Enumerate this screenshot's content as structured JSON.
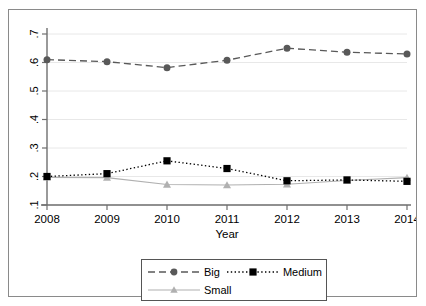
{
  "chart_data": {
    "type": "line",
    "title": "",
    "subtitle": "",
    "xlabel": "Year",
    "ylabel": "",
    "x": [
      2008,
      2009,
      2010,
      2011,
      2012,
      2013,
      2014
    ],
    "categories": [
      "2008",
      "2009",
      "2010",
      "2011",
      "2012",
      "2013",
      "2014"
    ],
    "xlim": [
      2008,
      2014
    ],
    "ylim": [
      0.1,
      0.7
    ],
    "yticks": [
      0.1,
      0.2,
      0.3,
      0.4,
      0.5,
      0.6,
      0.7
    ],
    "ytick_labels": [
      ".1",
      ".2",
      ".3",
      ".4",
      ".5",
      ".6",
      ".7"
    ],
    "xticks": [
      2008,
      2009,
      2010,
      2011,
      2012,
      2013,
      2014
    ],
    "xtick_labels": [
      "2008",
      "2009",
      "2010",
      "2011",
      "2012",
      "2013",
      "2014"
    ],
    "grid": true,
    "grid_axis": "y",
    "grid_color": "#e8e8e8",
    "legend_position": "bottom",
    "series": [
      {
        "name": "Big",
        "values": [
          0.61,
          0.603,
          0.582,
          0.608,
          0.65,
          0.636,
          0.63
        ],
        "color": "#595959",
        "marker": "circle",
        "linestyle": "dashed"
      },
      {
        "name": "Medium",
        "values": [
          0.2,
          0.21,
          0.255,
          0.228,
          0.185,
          0.188,
          0.183
        ],
        "color": "#000000",
        "marker": "square",
        "linestyle": "dotted"
      },
      {
        "name": "Small",
        "values": [
          0.197,
          0.196,
          0.172,
          0.17,
          0.173,
          0.186,
          0.196
        ],
        "color": "#b0b0b0",
        "marker": "triangle",
        "linestyle": "solid"
      }
    ]
  },
  "axis": {
    "x_title": "Year",
    "y_tick_0": ".1",
    "y_tick_1": ".2",
    "y_tick_2": ".3",
    "y_tick_3": ".4",
    "y_tick_4": ".5",
    "y_tick_5": ".6",
    "y_tick_6": ".7",
    "x_tick_0": "2008",
    "x_tick_1": "2009",
    "x_tick_2": "2010",
    "x_tick_3": "2011",
    "x_tick_4": "2012",
    "x_tick_5": "2013",
    "x_tick_6": "2014"
  },
  "legend": {
    "big_label": "Big",
    "medium_label": "Medium",
    "small_label": "Small"
  },
  "colors": {
    "big": "#595959",
    "medium": "#000000",
    "small": "#b0b0b0",
    "axis": "#6f6f6f",
    "grid": "#e8e8e8",
    "frame": "#8a8a8a",
    "background": "#ffffff"
  }
}
